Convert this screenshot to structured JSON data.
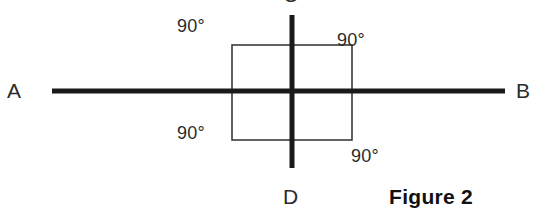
{
  "figure": {
    "caption": "Figure 2",
    "background_color": "#ffffff",
    "stroke_color": "#1a1a1a",
    "thin_stroke_color": "#3a3a3a"
  },
  "lines": {
    "horizontal": {
      "name": "line-AB",
      "start_label": "A",
      "end_label": "B",
      "x1": 52,
      "y1": 91,
      "x2": 505,
      "y2": 91,
      "stroke_width": 5
    },
    "vertical": {
      "name": "line-CD",
      "start_label": "C",
      "end_label": "D",
      "x1": 292,
      "y1": 15,
      "x2": 292,
      "y2": 168,
      "stroke_width": 5
    }
  },
  "square": {
    "name": "reference-square",
    "x": 232,
    "y": 45,
    "width": 120,
    "height": 95,
    "stroke_width": 1.6
  },
  "angles": [
    {
      "id": "top-left",
      "value": "90°",
      "quadrant": "upper-left"
    },
    {
      "id": "top-right",
      "value": "90°",
      "quadrant": "upper-right"
    },
    {
      "id": "bottom-left",
      "value": "90°",
      "quadrant": "lower-left"
    },
    {
      "id": "bottom-right",
      "value": "90°",
      "quadrant": "lower-right"
    }
  ],
  "labels": {
    "a": "A",
    "b": "B",
    "c": "C",
    "d": "D"
  }
}
